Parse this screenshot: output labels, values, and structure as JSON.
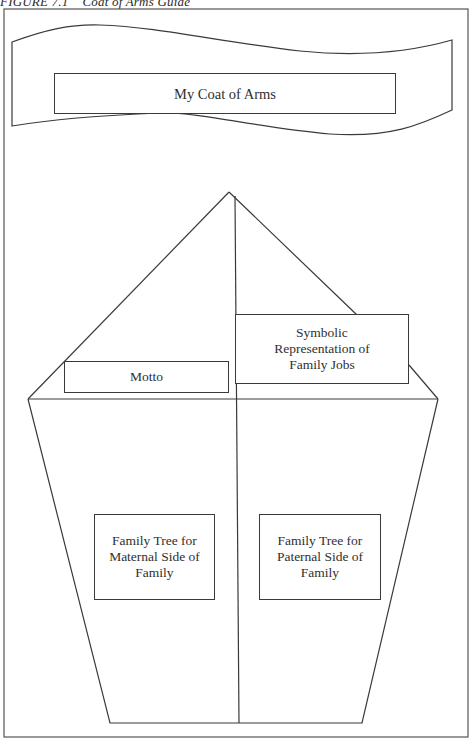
{
  "figure": {
    "caption_number": "FIGURE 7.1",
    "caption_title": "Coat of Arms Guide"
  },
  "banner": {
    "title": "My Coat of Arms"
  },
  "shield": {
    "motto": "Motto",
    "family_jobs": "Symbolic Representation of Family Jobs",
    "maternal_tree": "Family Tree for Maternal Side of Family",
    "paternal_tree": "Family Tree for Paternal Side of Family"
  },
  "colors": {
    "line": "#3a3a3a",
    "background": "#ffffff"
  }
}
